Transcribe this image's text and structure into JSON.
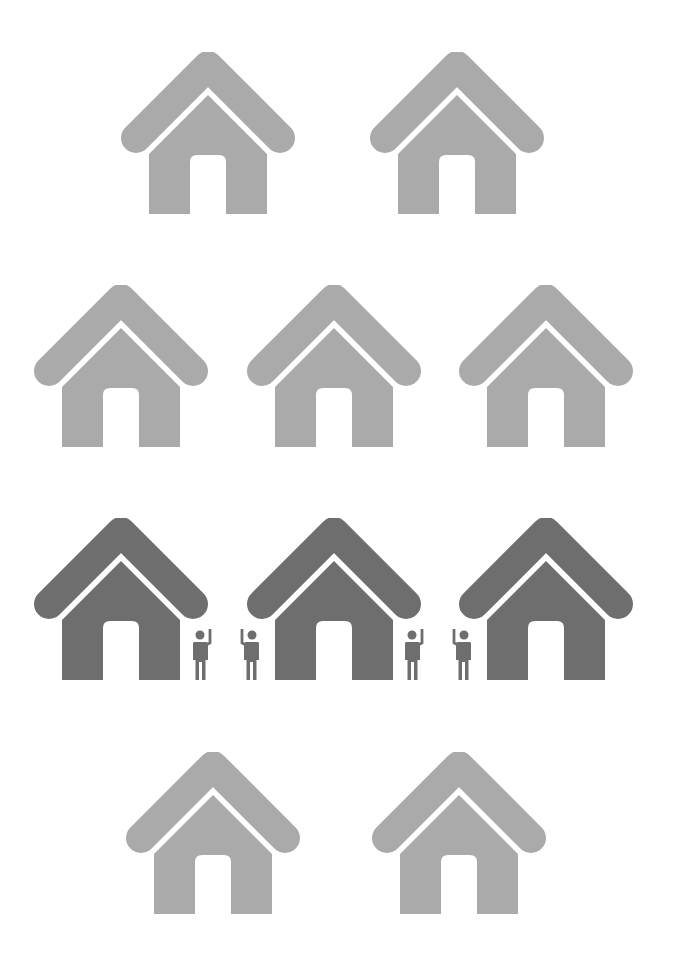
{
  "colors": {
    "light_house": "#aaaaaa",
    "dark_house": "#6e6e6e",
    "person": "#6e6e6e",
    "background": "#ffffff"
  },
  "rows": [
    {
      "houses": [
        {
          "shade": "light",
          "x": 120,
          "y": 52
        },
        {
          "shade": "light",
          "x": 369,
          "y": 52
        }
      ]
    },
    {
      "houses": [
        {
          "shade": "light",
          "x": 33,
          "y": 285
        },
        {
          "shade": "light",
          "x": 246,
          "y": 285
        },
        {
          "shade": "light",
          "x": 458,
          "y": 285
        }
      ]
    },
    {
      "houses": [
        {
          "shade": "dark",
          "x": 33,
          "y": 518
        },
        {
          "shade": "dark",
          "x": 246,
          "y": 518
        },
        {
          "shade": "dark",
          "x": 458,
          "y": 518
        }
      ],
      "people": [
        {
          "x": 191,
          "y": 629,
          "wave": "right"
        },
        {
          "x": 239,
          "y": 629,
          "wave": "left"
        },
        {
          "x": 403,
          "y": 629,
          "wave": "right"
        },
        {
          "x": 451,
          "y": 629,
          "wave": "left"
        }
      ]
    },
    {
      "houses": [
        {
          "shade": "light",
          "x": 125,
          "y": 752
        },
        {
          "shade": "light",
          "x": 371,
          "y": 752
        }
      ]
    }
  ],
  "summary": {
    "total_houses": 10,
    "occupied_houses": 3,
    "people_count": 4
  }
}
